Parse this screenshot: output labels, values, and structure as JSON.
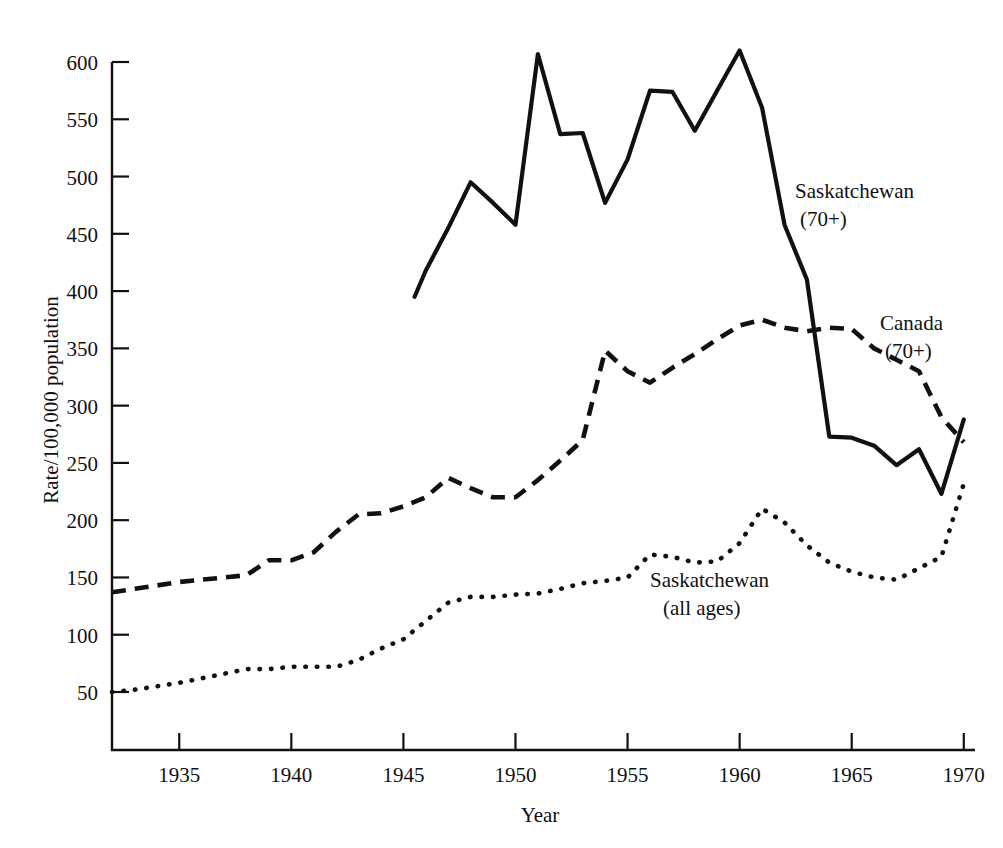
{
  "chart_data": {
    "type": "line",
    "title": "",
    "xlabel": "Year",
    "ylabel": "Rate/100,000 population",
    "xlim": [
      1932,
      1970.5
    ],
    "ylim": [
      0,
      625
    ],
    "grid": false,
    "legend_position": "inline-annotations",
    "xticks": [
      1935,
      1940,
      1945,
      1950,
      1955,
      1960,
      1965,
      1970
    ],
    "xtick_labels": [
      "1935",
      "1940",
      "1945",
      "1950",
      "1955",
      "1960",
      "1965",
      "1970"
    ],
    "yticks": [
      50,
      100,
      150,
      200,
      250,
      300,
      350,
      400,
      450,
      500,
      550,
      600
    ],
    "ytick_labels": [
      "50",
      "100",
      "150",
      "200",
      "250",
      "300",
      "350",
      "400",
      "450",
      "500",
      "550",
      "600"
    ],
    "series": [
      {
        "name": "Saskatchewan (70+)",
        "style": "solid",
        "annotation": {
          "line1": "Saskatchewan",
          "line2": "(70+)"
        },
        "x": [
          1945.5,
          1946,
          1947,
          1948,
          1949,
          1950,
          1951,
          1952,
          1953,
          1954,
          1955,
          1956,
          1957,
          1958,
          1959,
          1960,
          1961,
          1962,
          1963,
          1964,
          1965,
          1966,
          1967,
          1968,
          1969,
          1970
        ],
        "values": [
          395,
          418,
          455,
          495,
          477,
          458,
          607,
          537,
          538,
          477,
          515,
          575,
          574,
          540,
          575,
          610,
          560,
          458,
          410,
          273,
          272,
          265,
          248,
          262,
          223,
          288
        ]
      },
      {
        "name": "Canada (70+)",
        "style": "dashed",
        "annotation": {
          "line1": "Canada",
          "line2": "(70+)"
        },
        "x": [
          1932,
          1933,
          1934,
          1935,
          1936,
          1937,
          1938,
          1939,
          1940,
          1941,
          1942,
          1943,
          1944,
          1945,
          1946,
          1947,
          1948,
          1949,
          1950,
          1951,
          1952,
          1953,
          1954,
          1955,
          1956,
          1957,
          1958,
          1959,
          1960,
          1961,
          1962,
          1963,
          1964,
          1965,
          1966,
          1967,
          1968,
          1969,
          1970
        ],
        "values": [
          137,
          140,
          143,
          146,
          148,
          150,
          152,
          165,
          165,
          172,
          190,
          205,
          206,
          212,
          220,
          237,
          228,
          220,
          220,
          235,
          252,
          270,
          348,
          330,
          320,
          333,
          345,
          358,
          370,
          375,
          368,
          365,
          368,
          367,
          350,
          340,
          330,
          290,
          268
        ]
      },
      {
        "name": "Saskatchewan (all ages)",
        "style": "dotted",
        "annotation": {
          "line1": "Saskatchewan",
          "line2": "(all ages)"
        },
        "x": [
          1932,
          1933,
          1934,
          1935,
          1936,
          1937,
          1938,
          1939,
          1940,
          1941,
          1942,
          1943,
          1944,
          1945,
          1946,
          1947,
          1948,
          1949,
          1950,
          1951,
          1952,
          1953,
          1954,
          1955,
          1956,
          1957,
          1958,
          1959,
          1960,
          1961,
          1962,
          1963,
          1964,
          1965,
          1966,
          1967,
          1968,
          1969,
          1970
        ],
        "values": [
          50,
          52,
          55,
          58,
          62,
          66,
          70,
          70,
          72,
          72,
          72,
          78,
          88,
          96,
          112,
          128,
          133,
          133,
          135,
          136,
          140,
          145,
          147,
          150,
          170,
          168,
          163,
          164,
          180,
          210,
          198,
          178,
          163,
          155,
          150,
          148,
          158,
          168,
          232
        ]
      }
    ]
  },
  "axes": {
    "y_axis_title": "Rate/100,000 population",
    "x_axis_title": "Year"
  }
}
